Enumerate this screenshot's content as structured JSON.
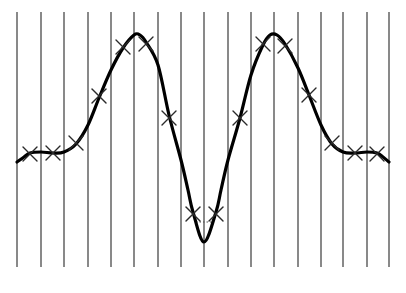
{
  "diagram": {
    "type": "sampled-signal",
    "canvas": {
      "width": 406,
      "height": 293
    },
    "colors": {
      "background": "#ffffff",
      "grid_line": "#4a4a4a",
      "curve": "#000000",
      "marker": "#2a2a2a",
      "connector": "#555555"
    },
    "grid": {
      "orientation": "vertical",
      "count": 17,
      "x_positions": [
        17,
        41,
        64,
        88,
        111,
        134,
        158,
        181,
        204,
        228,
        251,
        274,
        298,
        321,
        343,
        367,
        389
      ],
      "y_top": 12,
      "y_bottom": 267,
      "stroke_width": 1.3
    },
    "curve": {
      "stroke_width": 3.2,
      "points": [
        [
          17,
          162
        ],
        [
          24,
          157
        ],
        [
          30,
          153
        ],
        [
          41,
          152
        ],
        [
          53,
          153
        ],
        [
          64,
          152
        ],
        [
          76,
          144
        ],
        [
          88,
          125
        ],
        [
          99,
          98
        ],
        [
          111,
          70
        ],
        [
          123,
          48
        ],
        [
          134,
          35
        ],
        [
          140,
          35
        ],
        [
          146,
          42
        ],
        [
          158,
          65
        ],
        [
          169,
          115
        ],
        [
          181,
          160
        ],
        [
          188,
          190
        ],
        [
          193,
          212
        ],
        [
          204,
          242
        ],
        [
          216,
          212
        ],
        [
          221,
          190
        ],
        [
          228,
          160
        ],
        [
          240,
          118
        ],
        [
          251,
          75
        ],
        [
          263,
          45
        ],
        [
          270,
          35
        ],
        [
          277,
          35
        ],
        [
          285,
          44
        ],
        [
          298,
          68
        ],
        [
          309,
          95
        ],
        [
          321,
          125
        ],
        [
          332,
          144
        ],
        [
          343,
          152
        ],
        [
          355,
          153
        ],
        [
          367,
          152
        ],
        [
          377,
          153
        ],
        [
          383,
          157
        ],
        [
          389,
          162
        ]
      ]
    },
    "markers": {
      "glyph": "x-cross",
      "size": 7,
      "stroke_width": 1.4,
      "points": [
        [
          30,
          154
        ],
        [
          53,
          153
        ],
        [
          76,
          143
        ],
        [
          99,
          96
        ],
        [
          123,
          47
        ],
        [
          146,
          44
        ],
        [
          169,
          118
        ],
        [
          193,
          214
        ],
        [
          216,
          214
        ],
        [
          240,
          118
        ],
        [
          263,
          44
        ],
        [
          285,
          46
        ],
        [
          309,
          95
        ],
        [
          332,
          143
        ],
        [
          355,
          153
        ],
        [
          377,
          154
        ]
      ]
    },
    "valley_connector": {
      "style": "dotted",
      "from": [
        196,
        222
      ],
      "to": [
        213,
        222
      ]
    }
  }
}
